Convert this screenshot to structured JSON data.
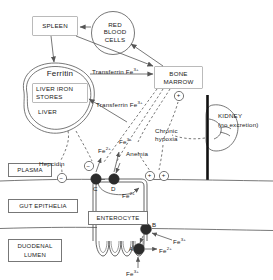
{
  "diagram": {
    "nodes": {
      "spleen": "SPLEEN",
      "red_blood_cells": "RED\nBLOOD\nCELLS",
      "bone_marrow": "BONE\nMARROW",
      "ferritin": "Ferritin",
      "liver_iron_stores": "LIVER IRON\nSTORES",
      "liver": "LIVER",
      "kidney": "KIDNEY",
      "kidney_note": "(no excretion)",
      "enterocyte": "ENTEROCYTE"
    },
    "compartments": {
      "plasma": "PLASMA",
      "gut_epithelia": "GUT EPITHELIA",
      "duodenal_lumen": "DUODENAL\nLUMEN"
    },
    "flow_labels": {
      "transferrin_top": "Transferrin Fe",
      "transferrin_top_charge": "3+",
      "transferrin_bottom": "Transferrin Fe",
      "transferrin_bottom_charge": "3+",
      "hepcidin": "Hepcidin",
      "anemia": "Anemia",
      "chronic_hypoxia": "Chronic\nhypoxia"
    },
    "ions": {
      "fe2_plasma_c": "Fe",
      "fe2_plasma_c_charge": "2+",
      "fe3_plasma": "Fe",
      "fe3_plasma_charge": "3+",
      "fe2_intracellular": "Fe",
      "fe2_intracellular_charge": "2+",
      "fe3_lumen_to_b": "Fe",
      "fe3_lumen_to_b_charge": "3+",
      "fe2_from_a": "Fe",
      "fe2_from_a_charge": "2+",
      "fe3_lumen_bottom": "Fe",
      "fe3_lumen_bottom_charge": "3+"
    },
    "transporters": {
      "a": "A",
      "b": "B",
      "c": "C",
      "d": "D"
    },
    "regulators": {
      "minus1": "−",
      "minus2": "−",
      "plus_bone_marrow": "+",
      "plus1": "+",
      "plus2": "+"
    },
    "colors": {
      "stroke": "#555555",
      "text": "#1a1a1a",
      "transporter_fill": "#2b2b2b",
      "vessel": "#111111",
      "background": "#ffffff"
    }
  }
}
